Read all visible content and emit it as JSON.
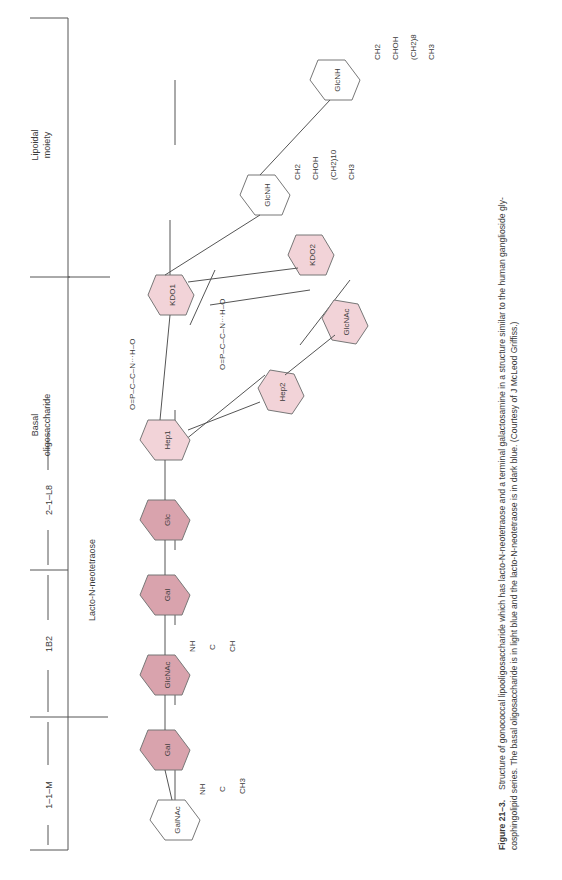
{
  "regions": {
    "lipoidal": [
      "Lipoidal",
      "moiety"
    ],
    "basal": [
      "Basal",
      "oligosaccharide"
    ],
    "lacto": "Lacto-N-neotetraose",
    "epitopes": [
      "1–1–M",
      "1B2",
      "2–1–L8"
    ]
  },
  "sugars": {
    "galnac": "GalNAc",
    "gal1": "Gal",
    "glcnac1": "GlcNAc",
    "gal2": "Gal",
    "glc": "Glc",
    "hep1": "Hep1",
    "hep2": "Hep2",
    "glcnac2": "GlcNAc",
    "kdo1": "KDO1",
    "kdo2": "KDO2",
    "glcnh1": "GlcNH",
    "glcnh2": "GlcNH"
  },
  "groups": {
    "acetyl_galnac": [
      "NH",
      "C",
      "O",
      "CH3"
    ],
    "acetyl_glcnac": [
      "NH",
      "C",
      "O",
      "CH"
    ],
    "ethanolamine_phosphate": "O=P–C–C–N···H–O",
    "lipid_a_chains": [
      "(CH2)8",
      "(CH2)10",
      "CH3",
      "CHOH",
      "CH2",
      "C=O"
    ]
  },
  "colors": {
    "lacto_neotetraose": "#d9a3ad",
    "basal_oligosaccharide": "#f2d3d8",
    "terminal": "#ffffff"
  },
  "caption": {
    "label": "Figure 21–3.",
    "line1": "Structure of gonococcal lipooligosaccharide which has lacto-N-neotetraose and a terminal galactosamine in a structure similar to the human ganglioside gly-",
    "line2": "cosphingolipid series. The basal oligosaccharide is in light blue and the lacto-N-neotetraose is in dark blue. (Courtesy of J McLeod Griffiss.)"
  }
}
